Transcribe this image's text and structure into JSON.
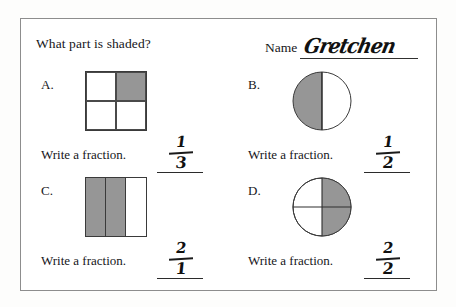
{
  "worksheet": {
    "title": "What part is shaded?",
    "name_label": "Name",
    "student_name": "Gretchen",
    "write_instruction": "Write a fraction.",
    "shade_color": "#969696",
    "ink_color": "#16161a",
    "border_color": "#8d8d8d"
  },
  "problems": [
    {
      "letter": "A.",
      "figure": "square-2x2-grid",
      "total_parts": 4,
      "shaded_parts": 1,
      "shaded_cells": [
        false,
        true,
        false,
        false
      ],
      "instruction": "Write a fraction.",
      "answer_numerator": "1",
      "answer_denominator": "3"
    },
    {
      "letter": "B.",
      "figure": "circle-halves-vertical",
      "total_parts": 2,
      "shaded_parts": 1,
      "shaded_cells": [
        true,
        false
      ],
      "instruction": "Write a fraction.",
      "answer_numerator": "1",
      "answer_denominator": "2"
    },
    {
      "letter": "C.",
      "figure": "rectangle-3-vertical-strips",
      "total_parts": 3,
      "shaded_parts": 2,
      "shaded_cells": [
        true,
        true,
        false
      ],
      "instruction": "Write a fraction.",
      "answer_numerator": "2",
      "answer_denominator": "1"
    },
    {
      "letter": "D.",
      "figure": "circle-quarters",
      "total_parts": 4,
      "shaded_parts": 2,
      "shaded_cells": [
        false,
        true,
        false,
        true
      ],
      "instruction": "Write a fraction.",
      "answer_numerator": "2",
      "answer_denominator": "2"
    }
  ]
}
